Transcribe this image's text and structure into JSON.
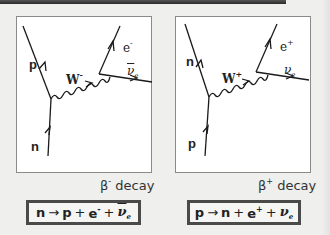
{
  "title_bar": {},
  "diagrams": [
    {
      "id": "beta-minus",
      "caption_symbol": "β",
      "caption_charge": "-",
      "caption_text": "decay",
      "particles": {
        "incoming_bottom": "n",
        "outgoing_top": "p",
        "boson": "W",
        "boson_charge": "-",
        "lepton": "e",
        "lepton_charge": "-",
        "neutrino": "ν",
        "neutrino_sub": "e",
        "neutrino_is_anti": true
      },
      "equation": {
        "lhs": "n",
        "arrow": "→",
        "terms": [
          "p",
          "+",
          "e",
          "+",
          "ν"
        ],
        "e_charge": "-",
        "nu_sub": "e"
      }
    },
    {
      "id": "beta-plus",
      "caption_symbol": "β",
      "caption_charge": "+",
      "caption_text": "decay",
      "particles": {
        "incoming_bottom": "p",
        "outgoing_top": "n",
        "boson": "W",
        "boson_charge": "+",
        "lepton": "e",
        "lepton_charge": "+",
        "neutrino": "ν",
        "neutrino_sub": "e",
        "neutrino_is_anti": false
      },
      "equation": {
        "lhs": "p",
        "arrow": "→",
        "terms": [
          "n",
          "+",
          "e",
          "+",
          "ν"
        ],
        "e_charge": "+",
        "nu_sub": "e"
      }
    }
  ],
  "colors": {
    "background": "#efefed",
    "panel": "#ffffff",
    "line": "#1a1a1a",
    "box_border": "#4a4a4a",
    "top_bar": "#3a3a3a"
  }
}
